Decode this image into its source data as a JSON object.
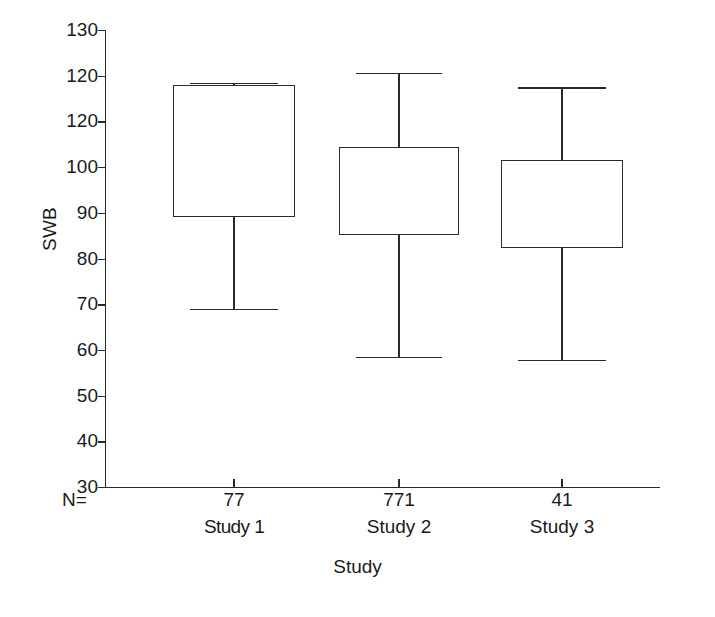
{
  "chart_data": {
    "type": "box",
    "title": "",
    "xlabel": "Study",
    "ylabel": "SWB",
    "ylim": [
      30,
      130
    ],
    "grid": false,
    "legend": null,
    "y_ticks": [
      130,
      120,
      120,
      100,
      90,
      80,
      70,
      60,
      50,
      40,
      30
    ],
    "y_tick_labels": [
      "130",
      "120",
      "120",
      "100",
      "90",
      "80",
      "70",
      "60",
      "50",
      "40",
      "30"
    ],
    "n_prefix_label": "N=",
    "categories": [
      "Study 1",
      "Study 2",
      "Study 3"
    ],
    "n_values": [
      "77",
      "771",
      "41"
    ],
    "boxes": [
      {
        "category": "Study 1",
        "n": "77",
        "whisker_low": 69.0,
        "q1": 89.0,
        "median": null,
        "q3": 118.0,
        "whisker_high": 118.5
      },
      {
        "category": "Study 2",
        "n": "771",
        "whisker_low": 58.5,
        "q1": 85.2,
        "median": null,
        "q3": 104.5,
        "whisker_high": 120.6
      },
      {
        "category": "Study 3",
        "n": "41",
        "whisker_low": 57.8,
        "q1": 82.3,
        "median": null,
        "q3": 101.5,
        "whisker_high": 117.5
      }
    ],
    "colors": {
      "line": "#2b2b2b",
      "background": "#ffffff",
      "box_fill": "transparent"
    }
  }
}
